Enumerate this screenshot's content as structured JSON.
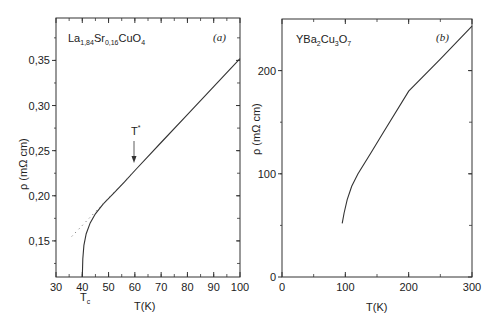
{
  "chart_data": [
    {
      "type": "line",
      "panel": "(a)",
      "title": "La1,84Sr0,16CuO4",
      "title_parts": {
        "a": "La",
        "a_sub": "1,84",
        "b": "Sr",
        "b_sub": "0,16",
        "c": "CuO",
        "c_sub": "4"
      },
      "xlabel": "T(K)",
      "ylabel": "ρ (mΩ cm)",
      "xlim": [
        30,
        100
      ],
      "ylim": [
        0.11,
        0.397
      ],
      "xticks": [
        "30",
        "40",
        "50",
        "60",
        "70",
        "80",
        "90",
        "100"
      ],
      "yticks": [
        "0,15",
        "0,20",
        "0,25",
        "0,30",
        "0,35"
      ],
      "grid": false,
      "series": [
        {
          "name": "resistivity",
          "style": "solid",
          "x": [
            40,
            40.2,
            40.6,
            41.5,
            43,
            45,
            48,
            52,
            56,
            60,
            70,
            80,
            90,
            100
          ],
          "y": [
            0.11,
            0.13,
            0.145,
            0.158,
            0.17,
            0.18,
            0.191,
            0.203,
            0.215,
            0.228,
            0.259,
            0.29,
            0.321,
            0.352
          ]
        },
        {
          "name": "linear extrapolation",
          "style": "dotted",
          "x": [
            36,
            60
          ],
          "y": [
            0.155,
            0.228
          ]
        }
      ],
      "annotations": [
        {
          "text": "T*",
          "x": 60,
          "y": 0.228,
          "type": "arrow-down"
        },
        {
          "text": "Tc",
          "x": 40,
          "position": "below-axis"
        }
      ]
    },
    {
      "type": "line",
      "panel": "(b)",
      "title": "YBa2Cu3O7",
      "title_parts": {
        "a": "YBa",
        "a_sub": "2",
        "b": "Cu",
        "b_sub": "3",
        "c": "O",
        "c_sub": "7"
      },
      "xlabel": "T(K)",
      "ylabel": "ρ (mΩ cm)",
      "xlim": [
        0,
        300
      ],
      "ylim": [
        0,
        250
      ],
      "xticks": [
        "0",
        "100",
        "200",
        "300"
      ],
      "yticks": [
        "0",
        "100",
        "200"
      ],
      "grid": false,
      "series": [
        {
          "name": "resistivity",
          "style": "solid",
          "x": [
            95,
            98,
            103,
            110,
            120,
            140,
            160,
            200,
            250,
            300
          ],
          "y": [
            52,
            62,
            75,
            88,
            100,
            120,
            140,
            180,
            211,
            243
          ]
        }
      ]
    }
  ],
  "labels": {
    "a_tag": "(a)",
    "b_tag": "(b)",
    "tstar": "T",
    "tstar_sup": "*",
    "tc": "T",
    "tc_sub": "c",
    "xlabel": "T(K)",
    "ylabel": "ρ (mΩ cm)"
  }
}
